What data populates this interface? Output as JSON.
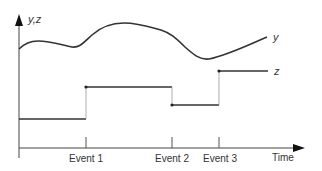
{
  "diagram": {
    "axes": {
      "y_label": "y,z",
      "x_label": "Time"
    },
    "series": {
      "y_label": "y",
      "z_label": "z"
    },
    "events": [
      {
        "label": "Event 1"
      },
      {
        "label": "Event 2"
      },
      {
        "label": "Event 3"
      }
    ],
    "colors": {
      "line": "#333333",
      "axis": "#444444",
      "riser": "#999999",
      "background": "#ffffff"
    }
  }
}
